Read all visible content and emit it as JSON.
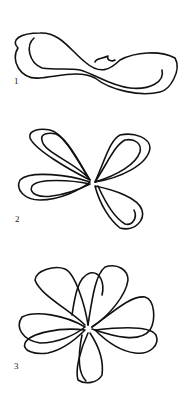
{
  "figure": {
    "type": "diagram",
    "steps": [
      {
        "label": "1",
        "description": "single ribbon loop figure-eight"
      },
      {
        "label": "2",
        "description": "double loop bow"
      },
      {
        "label": "3",
        "description": "full multi-loop bow"
      }
    ],
    "colors": {
      "stroke": "#111111",
      "background": "#ffffff"
    }
  }
}
